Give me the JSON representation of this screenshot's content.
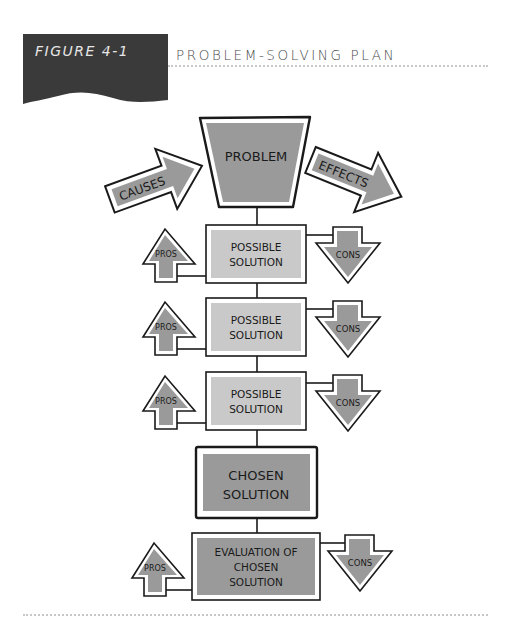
{
  "figure": {
    "number_label": "FIGURE 4-1",
    "title": "PROBLEM-SOLVING PLAN"
  },
  "diagram": {
    "problem": "PROBLEM",
    "causes": "CAUSES",
    "effects": "EFFECTS",
    "pros_label": "PROS",
    "cons_label": "CONS",
    "possible_solutions": [
      {
        "line1": "POSSIBLE",
        "line2": "SOLUTION"
      },
      {
        "line1": "POSSIBLE",
        "line2": "SOLUTION"
      },
      {
        "line1": "POSSIBLE",
        "line2": "SOLUTION"
      }
    ],
    "chosen": {
      "line1": "CHOSEN",
      "line2": "SOLUTION"
    },
    "evaluation": {
      "line1": "EVALUATION OF",
      "line2": "CHOSEN",
      "line3": "SOLUTION"
    }
  },
  "colors": {
    "banner": "#3a3a3a",
    "dark_fill": "#9a9a9a",
    "light_fill": "#c9c9c9",
    "stroke": "#1a1a1a",
    "dots": "#c8c8c8"
  }
}
